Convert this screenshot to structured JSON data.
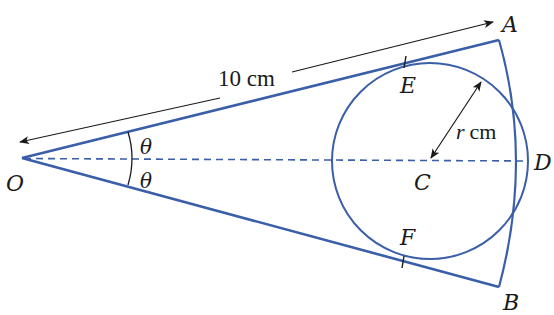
{
  "figure": {
    "type": "geometry-diagram",
    "colors": {
      "shape_stroke": "#3a5ea8",
      "annotation_stroke": "#1a1a1a",
      "background": "#ffffff"
    },
    "points": {
      "O": {
        "label": "O",
        "x": 22,
        "y": 158
      },
      "A": {
        "label": "A",
        "x": 499,
        "y": 40
      },
      "B": {
        "label": "B",
        "x": 499,
        "y": 287
      },
      "C": {
        "label": "C",
        "x": 430,
        "y": 161
      },
      "D": {
        "label": "D",
        "x": 528,
        "y": 161
      },
      "E": {
        "label": "E",
        "x": 405,
        "y": 62
      },
      "F": {
        "label": "F",
        "x": 403,
        "y": 262
      }
    },
    "labels": {
      "radius_length": "10 cm",
      "inner_radius": "r cm",
      "angle_top": "θ",
      "angle_bottom": "θ"
    },
    "circle": {
      "cx": 430,
      "cy": 161,
      "r": 98
    }
  }
}
